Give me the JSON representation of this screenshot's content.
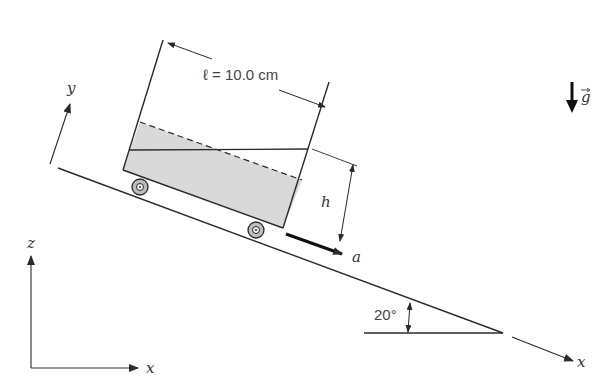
{
  "figure": {
    "length_label": "ℓ = 10.0 cm",
    "height_label": "h",
    "acceleration_label": "a",
    "angle_label": "20°",
    "gravity_label": "g",
    "incline_axes": {
      "x_label": "x",
      "y_label": "y"
    },
    "fixed_axes": {
      "x_label": "x",
      "z_label": "z"
    },
    "colors": {
      "line": "#2a2a2a",
      "liquid_fill": "#d9d9d9",
      "background": "#ffffff"
    }
  }
}
